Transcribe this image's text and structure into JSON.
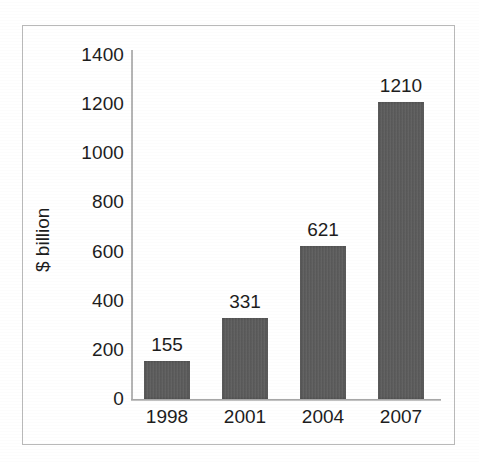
{
  "chart_data": {
    "type": "bar",
    "title": "",
    "subtitle": "",
    "xlabel": "",
    "ylabel": "$ billion",
    "categories": [
      "1998",
      "2001",
      "2004",
      "2007"
    ],
    "values": [
      155,
      331,
      621,
      1210
    ],
    "data_labels": [
      "155",
      "331",
      "621",
      "1210"
    ],
    "ylim": [
      0,
      1400
    ],
    "ytick_values": [
      1400,
      1200,
      1000,
      800,
      600,
      400,
      200,
      0
    ],
    "ytick_labels": [
      "1400",
      "1200",
      "1000",
      "800",
      "600",
      "400",
      "200",
      "0"
    ],
    "ytick_interval": 200,
    "grid": false,
    "legend": null,
    "legend_position": "none",
    "series": [
      {
        "name": "",
        "values": [
          155,
          331,
          621,
          1210
        ]
      }
    ],
    "annotations": [],
    "colors": {
      "bar_fill": "#5b5b5b",
      "axis_line": "#9a9a9a",
      "frame_border": "#b9b9b9",
      "text": "#1d1d1d",
      "background": "#ffffff"
    }
  }
}
